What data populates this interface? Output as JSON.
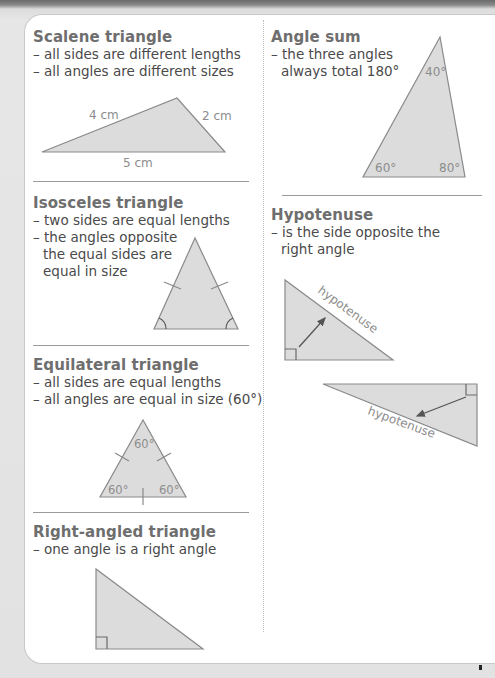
{
  "page": {
    "colors": {
      "background": "#e2e2e2",
      "panel": "#ffffff",
      "triangle_fill": "#dcdcdc",
      "triangle_stroke": "#8a8a8a",
      "title_text": "#6e6e6e",
      "body_text": "#4a4a4a",
      "label_text": "#8c8c8c"
    }
  },
  "left_column": {
    "scalene": {
      "title": "Scalene triangle",
      "bullets": [
        "– all sides are different lengths",
        "– all angles are different sizes"
      ],
      "labels": {
        "side_a": "4 cm",
        "side_b": "2 cm",
        "side_c": "5 cm"
      }
    },
    "isosceles": {
      "title": "Isosceles triangle",
      "bullets": [
        "– two sides are equal lengths",
        "– the angles opposite",
        "the equal sides are",
        "equal in size"
      ]
    },
    "equilateral": {
      "title": "Equilateral triangle",
      "bullets": [
        "– all sides are equal lengths",
        "– all angles are equal in size (60°)"
      ],
      "labels": {
        "top": "60°",
        "left": "60°",
        "right": "60°"
      }
    },
    "right_angled": {
      "title": "Right-angled triangle",
      "bullets": [
        "– one angle is a right angle"
      ]
    }
  },
  "right_column": {
    "angle_sum": {
      "title": "Angle sum",
      "bullets": [
        "– the three angles",
        "always total 180°"
      ],
      "labels": {
        "top": "40°",
        "left": "60°",
        "right": "80°"
      }
    },
    "hypotenuse": {
      "title": "Hypotenuse",
      "bullets": [
        "– is the side opposite the",
        "right angle"
      ],
      "labels": {
        "diagram_1": "hypotenuse",
        "diagram_2": "hypotenuse"
      }
    }
  }
}
